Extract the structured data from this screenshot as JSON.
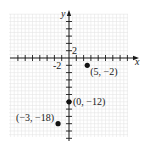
{
  "chart_data": {
    "type": "scatter",
    "title": "",
    "xlabel": "x",
    "ylabel": "y",
    "grid": true,
    "tick_step": 2,
    "tick_labels": {
      "x": [
        "-2"
      ],
      "y": [
        "2"
      ]
    },
    "xlim": [
      -16,
      16
    ],
    "ylim": [
      -22,
      12
    ],
    "points": [
      {
        "x": 5,
        "y": -2,
        "label": "(5, −2)"
      },
      {
        "x": 0,
        "y": -12,
        "label": "(0, −12)"
      },
      {
        "x": -3,
        "y": -18,
        "label": "(−3, −18)"
      }
    ]
  },
  "colors": {
    "axis": "#1a1a1a",
    "grid": "#e6e6e6",
    "point": "#111111"
  }
}
